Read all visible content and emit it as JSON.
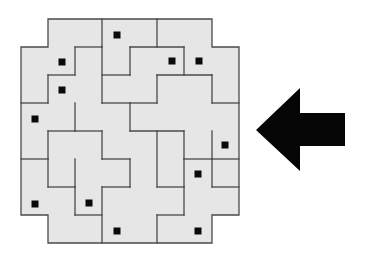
{
  "figure": {
    "title": "Tiled puzzle with marked squares and left-pointing arrow",
    "background": "#ffffff",
    "tile_color": "#e6e6e6",
    "edge_color": "#4a4a4a",
    "dot_color": "#0a0a0a",
    "arrow_color": "#050505"
  },
  "puzzle": {
    "outline": [
      [
        48,
        19
      ],
      [
        212,
        19
      ],
      [
        212,
        47
      ],
      [
        239,
        47
      ],
      [
        239,
        215
      ],
      [
        212,
        215
      ],
      [
        212,
        243
      ],
      [
        48,
        243
      ],
      [
        48,
        215
      ],
      [
        21,
        215
      ],
      [
        21,
        47
      ],
      [
        48,
        47
      ]
    ],
    "edges": [
      [
        [
          102,
          19
        ],
        [
          102,
          47
        ]
      ],
      [
        [
          157,
          19
        ],
        [
          157,
          47
        ]
      ],
      [
        [
          75,
          47
        ],
        [
          102,
          47
        ]
      ],
      [
        [
          75,
          47
        ],
        [
          75,
          75
        ]
      ],
      [
        [
          48,
          75
        ],
        [
          75,
          75
        ]
      ],
      [
        [
          48,
          75
        ],
        [
          48,
          103
        ]
      ],
      [
        [
          21,
          103
        ],
        [
          48,
          103
        ]
      ],
      [
        [
          102,
          47
        ],
        [
          102,
          103
        ]
      ],
      [
        [
          102,
          103
        ],
        [
          130,
          103
        ]
      ],
      [
        [
          130,
          47
        ],
        [
          184,
          47
        ]
      ],
      [
        [
          130,
          47
        ],
        [
          130,
          75
        ]
      ],
      [
        [
          102,
          75
        ],
        [
          130,
          75
        ]
      ],
      [
        [
          184,
          47
        ],
        [
          184,
          75
        ]
      ],
      [
        [
          157,
          75
        ],
        [
          212,
          75
        ]
      ],
      [
        [
          157,
          75
        ],
        [
          157,
          103
        ]
      ],
      [
        [
          212,
          75
        ],
        [
          212,
          103
        ]
      ],
      [
        [
          212,
          103
        ],
        [
          239,
          103
        ]
      ],
      [
        [
          130,
          103
        ],
        [
          130,
          131
        ]
      ],
      [
        [
          130,
          103
        ],
        [
          157,
          103
        ]
      ],
      [
        [
          75,
          103
        ],
        [
          75,
          131
        ]
      ],
      [
        [
          48,
          131
        ],
        [
          75,
          131
        ]
      ],
      [
        [
          48,
          131
        ],
        [
          48,
          159
        ]
      ],
      [
        [
          21,
          159
        ],
        [
          48,
          159
        ]
      ],
      [
        [
          75,
          131
        ],
        [
          102,
          131
        ]
      ],
      [
        [
          102,
          131
        ],
        [
          102,
          159
        ]
      ],
      [
        [
          102,
          159
        ],
        [
          130,
          159
        ]
      ],
      [
        [
          130,
          131
        ],
        [
          184,
          131
        ]
      ],
      [
        [
          184,
          131
        ],
        [
          184,
          159
        ]
      ],
      [
        [
          184,
          159
        ],
        [
          212,
          159
        ]
      ],
      [
        [
          212,
          131
        ],
        [
          212,
          159
        ]
      ],
      [
        [
          212,
          159
        ],
        [
          239,
          159
        ]
      ],
      [
        [
          157,
          131
        ],
        [
          157,
          187
        ]
      ],
      [
        [
          130,
          159
        ],
        [
          130,
          187
        ]
      ],
      [
        [
          48,
          159
        ],
        [
          48,
          187
        ]
      ],
      [
        [
          48,
          187
        ],
        [
          75,
          187
        ]
      ],
      [
        [
          75,
          159
        ],
        [
          75,
          187
        ]
      ],
      [
        [
          75,
          187
        ],
        [
          75,
          215
        ]
      ],
      [
        [
          75,
          215
        ],
        [
          102,
          215
        ]
      ],
      [
        [
          102,
          187
        ],
        [
          102,
          243
        ]
      ],
      [
        [
          102,
          187
        ],
        [
          130,
          187
        ]
      ],
      [
        [
          157,
          187
        ],
        [
          184,
          187
        ]
      ],
      [
        [
          184,
          159
        ],
        [
          184,
          187
        ]
      ],
      [
        [
          184,
          187
        ],
        [
          184,
          215
        ]
      ],
      [
        [
          157,
          215
        ],
        [
          184,
          215
        ]
      ],
      [
        [
          157,
          215
        ],
        [
          157,
          243
        ]
      ],
      [
        [
          212,
          187
        ],
        [
          239,
          187
        ]
      ],
      [
        [
          212,
          159
        ],
        [
          212,
          187
        ]
      ]
    ],
    "dots": [
      {
        "x": 117,
        "y": 35
      },
      {
        "x": 62,
        "y": 62
      },
      {
        "x": 172,
        "y": 61
      },
      {
        "x": 199,
        "y": 61
      },
      {
        "x": 62,
        "y": 90
      },
      {
        "x": 35,
        "y": 119
      },
      {
        "x": 225,
        "y": 145
      },
      {
        "x": 198,
        "y": 174
      },
      {
        "x": 35,
        "y": 204
      },
      {
        "x": 89,
        "y": 203
      },
      {
        "x": 117,
        "y": 231
      },
      {
        "x": 198,
        "y": 231
      }
    ],
    "dot_size": 7
  },
  "arrow": {
    "direction": "left",
    "label": "left-pointing arrow",
    "points": [
      [
        256,
        130
      ],
      [
        300,
        88
      ],
      [
        300,
        113
      ],
      [
        345,
        113
      ],
      [
        345,
        146
      ],
      [
        300,
        146
      ],
      [
        300,
        171
      ]
    ]
  }
}
